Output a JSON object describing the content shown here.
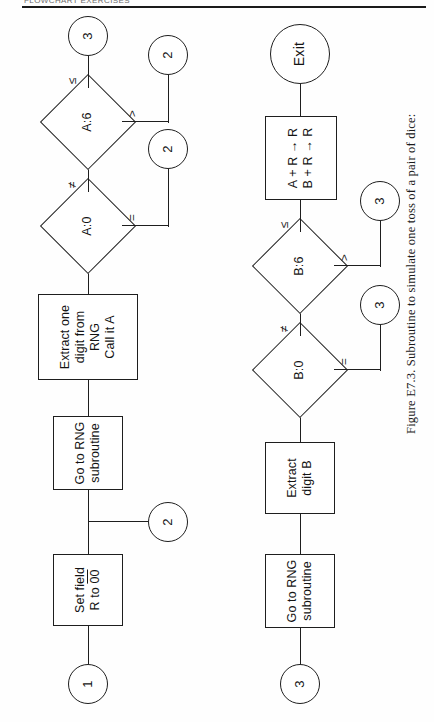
{
  "page": {
    "running_head": "FLOWCHART EXERCISES",
    "caption": "Figure E7.3.  Subroutine to simulate one toss of a pair of dice:"
  },
  "flowchart": {
    "title": "Subroutine to simulate one toss of a pair of dice",
    "nodes": {
      "start_1": {
        "type": "connector",
        "label": "1"
      },
      "set_field": {
        "type": "process",
        "line1": "Set field",
        "line2": "R to 00"
      },
      "entry_2": {
        "type": "connector",
        "label": "2"
      },
      "goto_rng_a": {
        "type": "process",
        "line1": "Go to RNG",
        "line2": "subroutine"
      },
      "extract_a": {
        "type": "process",
        "line1": "Extract one",
        "line2": "digit from RNG",
        "line3": "Call it A"
      },
      "dec_a0": {
        "type": "decision",
        "label": "A:0"
      },
      "out_2a": {
        "type": "connector",
        "label": "2"
      },
      "dec_a6": {
        "type": "decision",
        "label": "A:6"
      },
      "out_2b": {
        "type": "connector",
        "label": "2"
      },
      "out_3a": {
        "type": "connector",
        "label": "3"
      },
      "start_3": {
        "type": "connector",
        "label": "3"
      },
      "goto_rng_b": {
        "type": "process",
        "line1": "Go to RNG",
        "line2": "subroutine"
      },
      "extract_b": {
        "type": "process",
        "line1": "Extract",
        "line2": "digit B"
      },
      "dec_b0": {
        "type": "decision",
        "label": "B:0"
      },
      "out_3b": {
        "type": "connector",
        "label": "3"
      },
      "dec_b6": {
        "type": "decision",
        "label": "B:6"
      },
      "out_3c": {
        "type": "connector",
        "label": "3"
      },
      "accumulate": {
        "type": "process",
        "line1": "A + R → R",
        "line2": "B + R → R"
      },
      "exit": {
        "type": "terminal",
        "label": "Exit"
      }
    },
    "branch_labels": {
      "a0_equal": "=",
      "a0_notequal": "≠",
      "a6_greater": ">",
      "a6_lessequal": "≤",
      "b0_equal": "=",
      "b0_notequal": "≠",
      "b6_greater": ">",
      "b6_lessequal": "≤"
    }
  },
  "colors": {
    "ink": "#1e1e1e",
    "paper": "#fefefe"
  }
}
